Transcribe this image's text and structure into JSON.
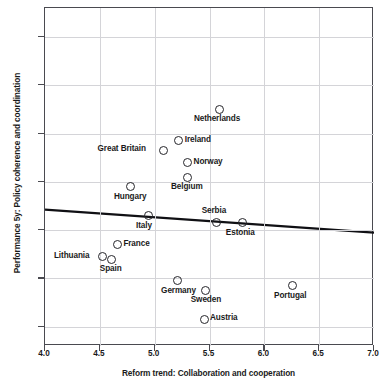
{
  "chart_data": {
    "type": "scatter",
    "title": "",
    "xlabel": "Reform trend: Collaboration and cooperation",
    "ylabel": "Performance 5y: Policy coherence and coordination",
    "xlim": [
      4.0,
      7.0
    ],
    "ylim": [
      3.52,
      4.92
    ],
    "xticks": [
      "4.0",
      "4.5",
      "5.0",
      "5.5",
      "6.0",
      "6.5",
      "7.0"
    ],
    "xtick_values": [
      4.0,
      4.5,
      5.0,
      5.5,
      6.0,
      6.5,
      7.0
    ],
    "yticks": [
      "3.6",
      "3.8",
      "4.0",
      "4.2",
      "4.4",
      "4.6",
      "4.8"
    ],
    "ytick_values": [
      3.6,
      3.8,
      4.0,
      4.2,
      4.4,
      4.6,
      4.8
    ],
    "grid": true,
    "legend": "none",
    "marker": "open-circle",
    "points": [
      {
        "label": "Netherlands",
        "x": 5.59,
        "y": 4.5,
        "label_pos": "below"
      },
      {
        "label": "Ireland",
        "x": 5.22,
        "y": 4.37,
        "label_pos": "right"
      },
      {
        "label": "Great Britain",
        "x": 5.08,
        "y": 4.33,
        "label_pos": "left"
      },
      {
        "label": "Norway",
        "x": 5.3,
        "y": 4.28,
        "label_pos": "right"
      },
      {
        "label": "Belgium",
        "x": 5.3,
        "y": 4.22,
        "label_pos": "below"
      },
      {
        "label": "Hungary",
        "x": 4.78,
        "y": 4.18,
        "label_pos": "below"
      },
      {
        "label": "Italy",
        "x": 4.94,
        "y": 4.06,
        "label_pos": "below"
      },
      {
        "label": "Serbia",
        "x": 5.56,
        "y": 4.03,
        "label_pos": "above"
      },
      {
        "label": "Estonia",
        "x": 5.8,
        "y": 4.03,
        "label_pos": "below"
      },
      {
        "label": "France",
        "x": 4.66,
        "y": 3.94,
        "label_pos": "right"
      },
      {
        "label": "Lithuania",
        "x": 4.52,
        "y": 3.89,
        "label_pos": "left"
      },
      {
        "label": "Spain",
        "x": 4.61,
        "y": 3.88,
        "label_pos": "below"
      },
      {
        "label": "Germany",
        "x": 5.21,
        "y": 3.79,
        "label_pos": "below"
      },
      {
        "label": "Sweden",
        "x": 5.46,
        "y": 3.75,
        "label_pos": "below"
      },
      {
        "label": "Portugal",
        "x": 6.26,
        "y": 3.77,
        "label_pos": "below"
      },
      {
        "label": "Austria",
        "x": 5.45,
        "y": 3.63,
        "label_pos": "right"
      }
    ],
    "trendline": {
      "type": "linear-fit",
      "x_start": 4.0,
      "y_start": 4.085,
      "x_end": 7.0,
      "y_end": 3.99,
      "color": "#101014"
    }
  },
  "colors": {
    "axis": "#4a4a50",
    "grid": "#d4d4d8",
    "marker": "#26262b",
    "text": "#1a1a1a"
  }
}
